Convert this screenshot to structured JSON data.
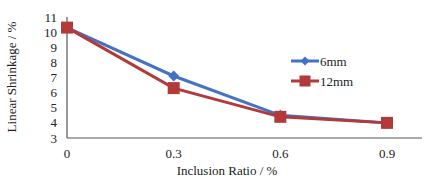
{
  "chart_data": {
    "type": "line",
    "title": "",
    "xlabel": "Inclusion Ratio / %",
    "ylabel": "Linear Shrinkage / %",
    "x": [
      0,
      0.3,
      0.6,
      0.9
    ],
    "x_tick_labels": [
      "0",
      "0.3",
      "0.6",
      "0.9"
    ],
    "y_tick_labels": [
      "3",
      "4",
      "5",
      "6",
      "7",
      "8",
      "9",
      "10",
      "11"
    ],
    "ylim": [
      3,
      11
    ],
    "grid": false,
    "legend_position": "right-center inside",
    "series": [
      {
        "name": "6mm",
        "marker": "diamond",
        "color": "#4472C4",
        "values": [
          10.3,
          7.1,
          4.5,
          4.0
        ]
      },
      {
        "name": "12mm",
        "marker": "square",
        "color": "#B23A3A",
        "values": [
          10.3,
          6.3,
          4.4,
          4.0
        ]
      }
    ]
  }
}
